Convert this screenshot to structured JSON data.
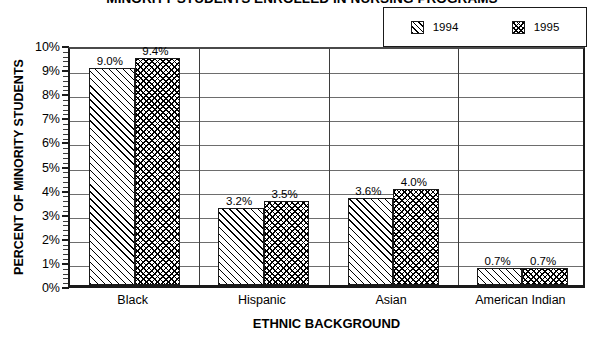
{
  "chart_data": {
    "type": "bar",
    "title": "MINORITY STUDENTS ENROLLED IN NURSING PROGRAMS",
    "xlabel": "ETHNIC BACKGROUND",
    "ylabel": "PERCENT OF MINORITY STUDENTS",
    "categories": [
      "Black",
      "Hispanic",
      "Asian",
      "American  Indian"
    ],
    "series": [
      {
        "name": "1994",
        "values": [
          9.0,
          3.2,
          3.6,
          0.7
        ],
        "labels": [
          "9.0%",
          "3.2%",
          "3.6%",
          "0.7%"
        ],
        "pattern": "diagonal-hatch"
      },
      {
        "name": "1995",
        "values": [
          9.4,
          3.5,
          4.0,
          0.7
        ],
        "labels": [
          "9.4%",
          "3.5%",
          "4.0%",
          "0.7%"
        ],
        "pattern": "cross-hatch"
      }
    ],
    "ylim": [
      0,
      10
    ],
    "ytick_labels": [
      "0%",
      "1%",
      "2%",
      "3%",
      "4%",
      "5%",
      "6%",
      "7%",
      "8%",
      "9%",
      "10%"
    ],
    "ytick_values": [
      0,
      1,
      2,
      3,
      4,
      5,
      6,
      7,
      8,
      9,
      10
    ],
    "grid": true,
    "grid_axis": "y",
    "legend_position": "top-right",
    "colors": {
      "axis": "#1a1a1a",
      "grid": "#6d6d6d",
      "text": "#000000",
      "background": "#ffffff"
    }
  },
  "legend": {
    "entries": [
      {
        "label": "1994"
      },
      {
        "label": "1995"
      }
    ]
  }
}
